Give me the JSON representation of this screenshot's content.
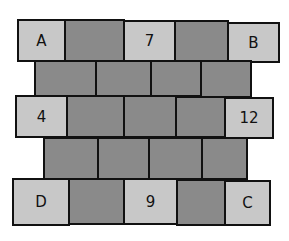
{
  "diagram": {
    "type": "brick-wall-puzzle",
    "colors": {
      "light": "#c8c8c8",
      "dark": "#8a8a8a",
      "outline": "#111111"
    },
    "rows": [
      {
        "bricks": [
          {
            "label": "A",
            "shade": "light"
          },
          {
            "label": "",
            "shade": "dark"
          },
          {
            "label": "7",
            "shade": "light"
          },
          {
            "label": "",
            "shade": "dark"
          },
          {
            "label": "B",
            "shade": "light"
          }
        ]
      },
      {
        "bricks": [
          {
            "label": "",
            "shade": "dark"
          },
          {
            "label": "",
            "shade": "dark"
          },
          {
            "label": "",
            "shade": "dark"
          },
          {
            "label": "",
            "shade": "dark"
          }
        ]
      },
      {
        "bricks": [
          {
            "label": "4",
            "shade": "light"
          },
          {
            "label": "",
            "shade": "dark"
          },
          {
            "label": "",
            "shade": "dark"
          },
          {
            "label": "",
            "shade": "dark"
          },
          {
            "label": "12",
            "shade": "light"
          }
        ]
      },
      {
        "bricks": [
          {
            "label": "",
            "shade": "dark"
          },
          {
            "label": "",
            "shade": "dark"
          },
          {
            "label": "",
            "shade": "dark"
          },
          {
            "label": "",
            "shade": "dark"
          }
        ]
      },
      {
        "bricks": [
          {
            "label": "D",
            "shade": "light"
          },
          {
            "label": "",
            "shade": "dark"
          },
          {
            "label": "9",
            "shade": "light"
          },
          {
            "label": "",
            "shade": "dark"
          },
          {
            "label": "C",
            "shade": "light"
          }
        ]
      }
    ]
  }
}
